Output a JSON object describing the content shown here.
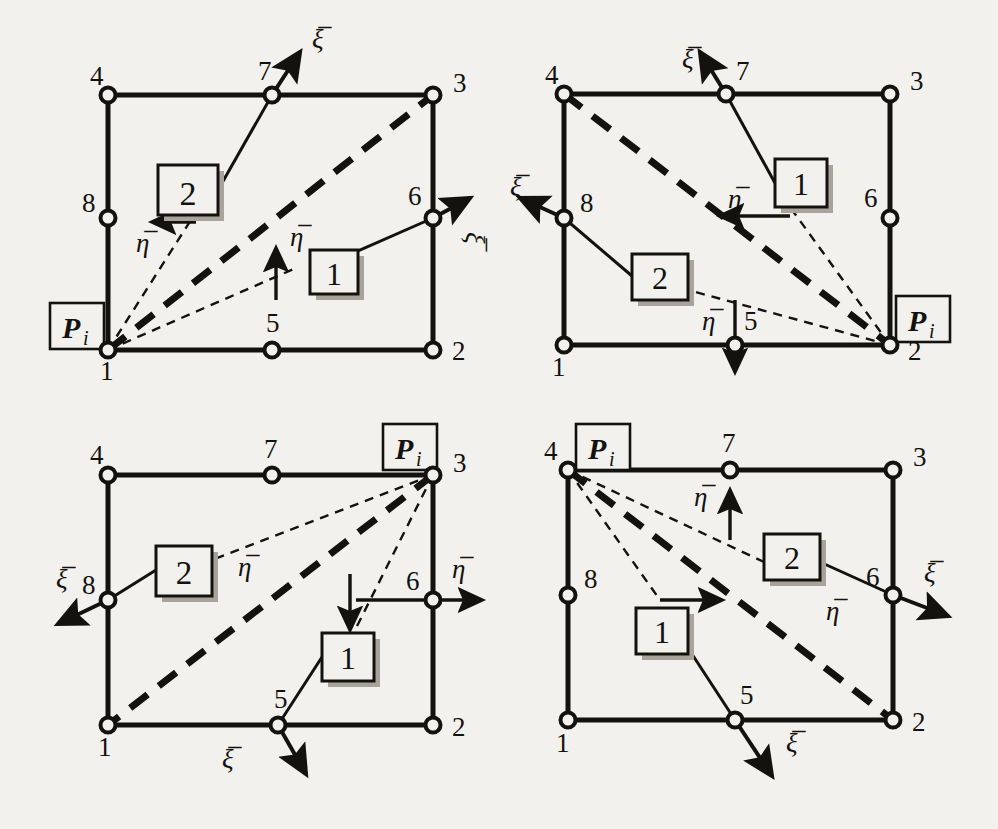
{
  "figure": {
    "colors": {
      "ink": "#14120f",
      "paper": "#f2f1ee",
      "shadow": "#9a958d"
    },
    "node_ids": [
      "1",
      "2",
      "3",
      "4",
      "5",
      "6",
      "7",
      "8"
    ],
    "axis_symbols": {
      "xi": "ξ̅",
      "eta": "η̅"
    },
    "box_labels": {
      "one": "1",
      "two": "2"
    },
    "pi_label": {
      "base": "P",
      "sub": "i"
    }
  },
  "panels": [
    {
      "id": "panel-top-left",
      "position": "top-left",
      "pi_node": "1",
      "pi_label": {
        "base": "P",
        "sub": "i"
      },
      "nodes": [
        {
          "id": "1",
          "label": "1",
          "x": 108,
          "y": 350,
          "label_x": 100,
          "label_y": 377
        },
        {
          "id": "2",
          "label": "2",
          "x": 433,
          "y": 350,
          "label_x": 453,
          "label_y": 360
        },
        {
          "id": "3",
          "label": "3",
          "x": 433,
          "y": 95,
          "label_x": 453,
          "label_y": 92
        },
        {
          "id": "4",
          "label": "4",
          "x": 108,
          "y": 95,
          "label_x": 90,
          "label_y": 85
        },
        {
          "id": "5",
          "label": "5",
          "x": 272,
          "y": 350,
          "label_x": 268,
          "label_y": 330
        },
        {
          "id": "6",
          "label": "6",
          "x": 433,
          "y": 218,
          "label_x": 410,
          "label_y": 205
        },
        {
          "id": "7",
          "label": "7",
          "x": 272,
          "y": 95,
          "label_x": 258,
          "label_y": 80
        },
        {
          "id": "8",
          "label": "8",
          "x": 108,
          "y": 218,
          "label_x": 88,
          "label_y": 210
        }
      ],
      "boxes": [
        {
          "name": "box-1",
          "label": "1",
          "x": 310,
          "y": 250,
          "w": 48,
          "h": 44
        },
        {
          "name": "box-2",
          "label": "2",
          "x": 158,
          "y": 165,
          "w": 60,
          "h": 50
        }
      ],
      "axes": [
        {
          "name": "xi-at-7",
          "symbol": "ξ̅",
          "label_x": 310,
          "label_y": 45,
          "rotate": 0
        },
        {
          "name": "xi-at-6",
          "symbol": "ξ̅",
          "label_x": 466,
          "label_y": 228,
          "rotate": 90
        },
        {
          "name": "eta-at-5",
          "symbol": "η̅",
          "label_x": 290,
          "label_y": 240,
          "rotate": 0
        },
        {
          "name": "eta-at-8",
          "symbol": "η̅",
          "label_x": 140,
          "label_y": 248,
          "rotate": 0
        }
      ]
    },
    {
      "id": "panel-top-right",
      "position": "top-right",
      "pi_node": "2",
      "pi_label": {
        "base": "P",
        "sub": "i"
      },
      "nodes": [
        {
          "id": "1",
          "label": "1",
          "x": 564,
          "y": 345,
          "label_x": 552,
          "label_y": 374
        },
        {
          "id": "2",
          "label": "2",
          "x": 890,
          "y": 345,
          "label_x": 910,
          "label_y": 357
        },
        {
          "id": "3",
          "label": "3",
          "x": 890,
          "y": 94,
          "label_x": 910,
          "label_y": 90
        },
        {
          "id": "4",
          "label": "4",
          "x": 564,
          "y": 94,
          "label_x": 545,
          "label_y": 84
        },
        {
          "id": "5",
          "label": "5",
          "x": 735,
          "y": 345,
          "label_x": 745,
          "label_y": 328
        },
        {
          "id": "6",
          "label": "6",
          "x": 890,
          "y": 218,
          "label_x": 866,
          "label_y": 207
        },
        {
          "id": "7",
          "label": "7",
          "x": 726,
          "y": 94,
          "label_x": 735,
          "label_y": 76
        },
        {
          "id": "8",
          "label": "8",
          "x": 564,
          "y": 218,
          "label_x": 582,
          "label_y": 208
        }
      ],
      "boxes": [
        {
          "name": "box-1",
          "label": "1",
          "x": 775,
          "y": 159,
          "w": 52,
          "h": 48
        },
        {
          "name": "box-2",
          "label": "2",
          "x": 632,
          "y": 254,
          "w": 56,
          "h": 46
        }
      ],
      "axes": [
        {
          "name": "xi-at-7",
          "symbol": "ξ̅",
          "label_x": 688,
          "label_y": 66,
          "rotate": 0
        },
        {
          "name": "xi-at-8",
          "symbol": "ξ̅",
          "label_x": 516,
          "label_y": 190,
          "rotate": 0
        },
        {
          "name": "eta-at-5",
          "symbol": "η̅",
          "label_x": 708,
          "label_y": 326,
          "rotate": 0
        },
        {
          "name": "eta-at-1-dir",
          "symbol": "η̅",
          "label_x": 734,
          "label_y": 203,
          "rotate": 0
        }
      ]
    },
    {
      "id": "panel-bottom-left",
      "position": "bottom-left",
      "pi_node": "3",
      "pi_label": {
        "base": "P",
        "sub": "i"
      },
      "nodes": [
        {
          "id": "1",
          "label": "1",
          "x": 108,
          "y": 725,
          "label_x": 98,
          "label_y": 754
        },
        {
          "id": "2",
          "label": "2",
          "x": 433,
          "y": 725,
          "label_x": 453,
          "label_y": 735
        },
        {
          "id": "3",
          "label": "3",
          "x": 433,
          "y": 475,
          "label_x": 453,
          "label_y": 472
        },
        {
          "id": "4",
          "label": "4",
          "x": 108,
          "y": 475,
          "label_x": 90,
          "label_y": 462
        },
        {
          "id": "5",
          "label": "5",
          "x": 278,
          "y": 725,
          "label_x": 280,
          "label_y": 706
        },
        {
          "id": "6",
          "label": "6",
          "x": 433,
          "y": 600,
          "label_x": 410,
          "label_y": 588
        },
        {
          "id": "7",
          "label": "7",
          "x": 272,
          "y": 475,
          "label_x": 272,
          "label_y": 455
        },
        {
          "id": "8",
          "label": "8",
          "x": 108,
          "y": 600,
          "label_x": 88,
          "label_y": 585
        }
      ],
      "boxes": [
        {
          "name": "box-1",
          "label": "1",
          "x": 322,
          "y": 633,
          "w": 52,
          "h": 48
        },
        {
          "name": "box-2",
          "label": "2",
          "x": 156,
          "y": 546,
          "w": 56,
          "h": 50
        }
      ],
      "axes": [
        {
          "name": "xi-at-8",
          "symbol": "ξ̅",
          "label_x": 60,
          "label_y": 580,
          "rotate": 0
        },
        {
          "name": "xi-at-5",
          "symbol": "ξ̅",
          "label_x": 226,
          "label_y": 760,
          "rotate": 0
        },
        {
          "name": "eta-at-6",
          "symbol": "η̅",
          "label_x": 455,
          "label_y": 570,
          "rotate": 0
        },
        {
          "name": "eta-at-7",
          "symbol": "η̅",
          "label_x": 243,
          "label_y": 570,
          "rotate": 0
        }
      ]
    },
    {
      "id": "panel-bottom-right",
      "position": "bottom-right",
      "pi_node": "4",
      "pi_label": {
        "base": "P",
        "sub": "i"
      },
      "nodes": [
        {
          "id": "1",
          "label": "1",
          "x": 568,
          "y": 720,
          "label_x": 556,
          "label_y": 750
        },
        {
          "id": "2",
          "label": "2",
          "x": 893,
          "y": 720,
          "label_x": 913,
          "label_y": 730
        },
        {
          "id": "3",
          "label": "3",
          "x": 893,
          "y": 470,
          "label_x": 913,
          "label_y": 466
        },
        {
          "id": "4",
          "label": "4",
          "x": 568,
          "y": 470,
          "label_x": 548,
          "label_y": 458
        },
        {
          "id": "5",
          "label": "5",
          "x": 735,
          "y": 720,
          "label_x": 744,
          "label_y": 702
        },
        {
          "id": "6",
          "label": "6",
          "x": 893,
          "y": 595,
          "label_x": 870,
          "label_y": 582
        },
        {
          "id": "7",
          "label": "7",
          "x": 730,
          "y": 470,
          "label_x": 730,
          "label_y": 450
        },
        {
          "id": "8",
          "label": "8",
          "x": 568,
          "y": 595,
          "label_x": 586,
          "label_y": 584
        }
      ],
      "boxes": [
        {
          "name": "box-1",
          "label": "1",
          "x": 636,
          "y": 608,
          "w": 52,
          "h": 46
        },
        {
          "name": "box-2",
          "label": "2",
          "x": 764,
          "y": 534,
          "w": 56,
          "h": 46
        }
      ],
      "axes": [
        {
          "name": "xi-at-6",
          "symbol": "ξ̅",
          "label_x": 928,
          "label_y": 576,
          "rotate": 0
        },
        {
          "name": "xi-at-5",
          "symbol": "ξ̅",
          "label_x": 790,
          "label_y": 744,
          "rotate": 0
        },
        {
          "name": "eta-at-7",
          "symbol": "η̅",
          "label_x": 700,
          "label_y": 500,
          "rotate": 0
        },
        {
          "name": "eta-at-1-dir",
          "symbol": "η̅",
          "label_x": 828,
          "label_y": 612,
          "rotate": 0
        }
      ]
    }
  ]
}
